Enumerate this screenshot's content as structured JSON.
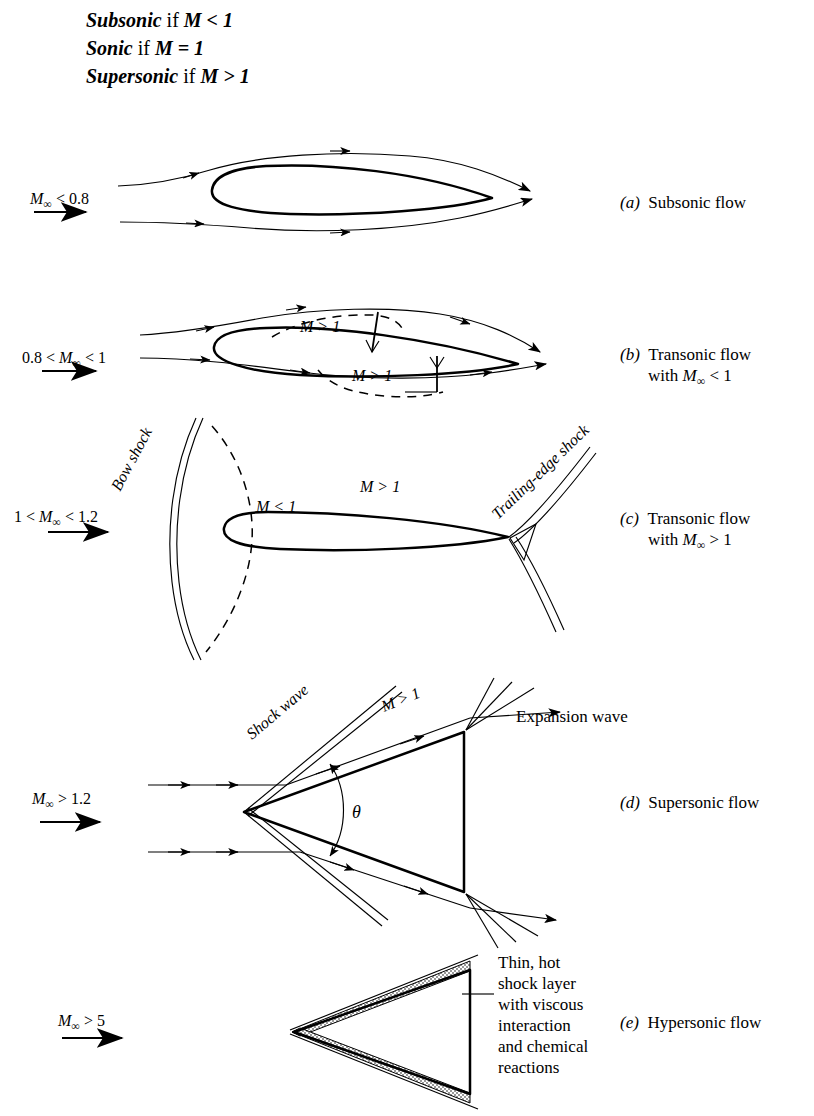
{
  "header": {
    "lines": [
      {
        "term": "Subsonic",
        "rest": "if ",
        "math": "M < 1"
      },
      {
        "term": "Sonic",
        "rest": "if ",
        "math": "M = 1"
      },
      {
        "term": "Supersonic",
        "rest": "if ",
        "math": "M > 1"
      }
    ]
  },
  "panels": [
    {
      "id": "a",
      "mach_label": "M∞ < 0.8",
      "caption_letter": "(a)",
      "caption_lines": [
        "Subsonic flow"
      ],
      "flow_labels": []
    },
    {
      "id": "b",
      "mach_label": "0.8 < M∞ < 1",
      "caption_letter": "(b)",
      "caption_lines": [
        "Transonic flow",
        "with M∞ < 1"
      ],
      "flow_labels": [
        "M > 1",
        "M > 1"
      ]
    },
    {
      "id": "c",
      "mach_label": "1 < M∞ < 1.2",
      "caption_letter": "(c)",
      "caption_lines": [
        "Transonic flow",
        "with M∞ > 1"
      ],
      "flow_labels": [
        "Bow shock",
        "M < 1",
        "M > 1",
        "Trailing-edge shock"
      ]
    },
    {
      "id": "d",
      "mach_label": "M∞ > 1.2",
      "caption_letter": "(d)",
      "caption_lines": [
        "Supersonic flow"
      ],
      "flow_labels": [
        "Shock wave",
        "M > 1",
        "Expansion wave",
        "θ"
      ]
    },
    {
      "id": "e",
      "mach_label": "M∞ > 5",
      "caption_letter": "(e)",
      "caption_lines": [
        "Hypersonic flow"
      ],
      "flow_labels": [
        "Thin, hot",
        "shock layer",
        "with viscous",
        "interaction",
        "and chemical",
        "reactions"
      ]
    }
  ],
  "labels": {
    "a_mach_pre": "",
    "a_mach_m": "M",
    "a_mach_post": " < 0.8",
    "b_mach_pre": "0.8 < ",
    "b_mach_m": "M",
    "b_mach_post": " < 1",
    "c_mach_pre": "1 < ",
    "c_mach_m": "M",
    "c_mach_post": " < 1.2",
    "d_mach_pre": "",
    "d_mach_m": "M",
    "d_mach_post": " > 1.2",
    "e_mach_pre": "",
    "e_mach_m": "M",
    "e_mach_post": " > 5",
    "bow_shock": "Bow shock",
    "te_shock": "Trailing-edge shock",
    "shock_wave": "Shock wave",
    "expansion_wave": "Expansion wave",
    "m_gt_1": "M > 1",
    "m_lt_1": "M < 1",
    "theta": "θ",
    "hyp1": "Thin, hot",
    "hyp2": "shock layer",
    "hyp3": "with viscous",
    "hyp4": "interaction",
    "hyp5": "and chemical",
    "hyp6": "reactions"
  },
  "captions": {
    "a_letter": "(a)",
    "a_l1": "Subsonic flow",
    "b_letter": "(b)",
    "b_l1": "Transonic flow",
    "b_l2pre": "with ",
    "b_l2m": "M",
    "b_l2post": " < 1",
    "c_letter": "(c)",
    "c_l1": "Transonic flow",
    "c_l2pre": "with ",
    "c_l2m": "M",
    "c_l2post": " > 1",
    "d_letter": "(d)",
    "d_l1": "Supersonic flow",
    "e_letter": "(e)",
    "e_l1": "Hypersonic flow"
  },
  "style": {
    "ink": "#000000",
    "paper": "#ffffff"
  }
}
